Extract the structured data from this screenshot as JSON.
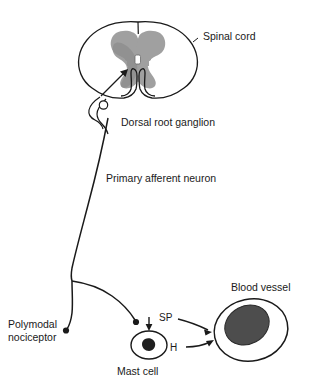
{
  "figure": {
    "background_color": "#ffffff",
    "line_color": "#1a1a1a",
    "gray_matter_color": "#a0a0a0",
    "dark_gray_color": "#8a8a8a",
    "lumen_color": "#4a4a4a",
    "nucleus_color": "#222222"
  },
  "labels": {
    "spinal_cord": "Spinal cord",
    "dorsal_root_ganglion": "Dorsal root ganglion",
    "primary_afferent_neuron": "Primary afferent neuron",
    "polymodal_line1": "Polymodal",
    "polymodal_line2": "nociceptor",
    "mast_cell": "Mast cell",
    "blood_vessel": "Blood vessel",
    "substance_p": "SP",
    "histamine": "H"
  },
  "structures": [
    {
      "name": "spinal-cord",
      "label": "Spinal cord"
    },
    {
      "name": "dorsal-root-ganglion",
      "label": "Dorsal root ganglion"
    },
    {
      "name": "primary-afferent-neuron",
      "label": "Primary afferent neuron"
    },
    {
      "name": "polymodal-nociceptor",
      "label": "Polymodal nociceptor"
    },
    {
      "name": "mast-cell",
      "label": "Mast cell"
    },
    {
      "name": "blood-vessel",
      "label": "Blood vessel"
    }
  ],
  "mediators": [
    {
      "name": "substance-p",
      "abbrev": "SP",
      "from": "primary-afferent-neuron",
      "to": "blood-vessel"
    },
    {
      "name": "histamine",
      "abbrev": "H",
      "from": "mast-cell",
      "to": "blood-vessel"
    }
  ]
}
